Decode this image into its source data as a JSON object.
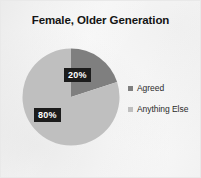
{
  "chart_data": {
    "type": "pie",
    "title": "Female, Older Generation",
    "categories": [
      "Agreed",
      "Anything Else"
    ],
    "values": [
      20,
      80
    ],
    "value_labels": [
      "20%",
      "80%"
    ],
    "units": "percent",
    "legend_position": "right",
    "start_angle_deg": 0,
    "direction": "clockwise",
    "grid": false,
    "colors": {
      "agreed": "#7f7f7f",
      "anything_else": "#bfbfbf",
      "label_background": "#1c1c1c",
      "label_text": "#ffffff",
      "title_text": "#141414",
      "legend_text": "#2b2b2b",
      "plot_background": "#fbfbfb",
      "frame_border": "#e9e9e9"
    }
  },
  "legend": {
    "items": [
      {
        "label": "Agreed",
        "color": "#7f7f7f"
      },
      {
        "label": "Anything Else",
        "color": "#bfbfbf"
      }
    ]
  }
}
